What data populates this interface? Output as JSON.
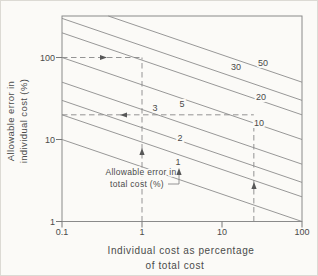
{
  "canvas": {
    "width": 318,
    "height": 276,
    "background": "#fbfaf7",
    "border": "#dcdad4"
  },
  "styles": {
    "contour_line_color": "#8c8c8c",
    "box_color": "#8a8a8a",
    "tick_color": "#787878",
    "text_color": "#4a4a4a",
    "arrow_color": "#575757",
    "guide_color": "#888888"
  },
  "chart_data": {
    "type": "line",
    "title": "",
    "x_axis": {
      "label": "Individual cost as percentage of total cost",
      "label_lines": [
        "Individual cost as percentage",
        "of total cost"
      ],
      "scale": "log",
      "min": 0.1,
      "max": 100,
      "ticks": [
        0.1,
        1,
        10,
        100
      ],
      "tick_labels": [
        "0.1",
        "1",
        "10",
        "100"
      ]
    },
    "y_axis": {
      "label": "Allowable error in individual cost (%)",
      "label_lines": [
        "Allowable error in",
        "individual cost (%)"
      ],
      "scale": "log",
      "min": 1,
      "max": 320,
      "ticks": [
        1,
        10,
        100
      ],
      "tick_labels": [
        "1",
        "10",
        "100"
      ]
    },
    "grid": false,
    "family_label": "Allowable error in total cost (%)",
    "relation": "individual_error_pct = total_error_pct * (100 / individual_cost_pct)^(1/3)",
    "contours": [
      {
        "total_error_pct": 1,
        "label": "1",
        "label_px": [
          177,
          161
        ]
      },
      {
        "total_error_pct": 2,
        "label": "2",
        "label_px": [
          179,
          137
        ]
      },
      {
        "total_error_pct": 3,
        "label": "3",
        "label_px": [
          154,
          107
        ]
      },
      {
        "total_error_pct": 5,
        "label": "5",
        "label_px": [
          181,
          103
        ]
      },
      {
        "total_error_pct": 10,
        "label": "10",
        "label_px": [
          258,
          122
        ]
      },
      {
        "total_error_pct": 20,
        "label": "20",
        "label_px": [
          260,
          96
        ]
      },
      {
        "total_error_pct": 30,
        "label": "30",
        "label_px": [
          235,
          66
        ]
      },
      {
        "total_error_pct": 50,
        "label": "50",
        "label_px": [
          262,
          62
        ]
      }
    ],
    "worked_example_guides": [
      {
        "type": "horizontal",
        "y": 100,
        "from_x": 0.1,
        "to_x": 1,
        "arrow": {
          "dir": "right",
          "px": [
            106,
            56.5
          ]
        }
      },
      {
        "type": "vertical",
        "x": 1,
        "from_y": 1,
        "to_y": 100,
        "arrow": {
          "dir": "up",
          "px": [
            141,
            147
          ]
        }
      },
      {
        "type": "horizontal",
        "y": 20,
        "from_x": 0.1,
        "to_x": 25,
        "arrow": {
          "dir": "left",
          "px": [
            119,
            114
          ]
        }
      },
      {
        "type": "vertical",
        "x": 25,
        "from_y": 1,
        "to_y": 16,
        "arrow": {
          "dir": "up",
          "px": [
            253,
            181
          ]
        }
      }
    ],
    "annotation": {
      "lines": [
        "Allowable error in",
        "total cost (%)"
      ],
      "line_px": [
        [
          140,
          174
        ],
        [
          136,
          186
        ]
      ],
      "leader": {
        "elbow": [
          [
            167,
            183
          ],
          [
            178,
            183
          ],
          [
            178,
            170
          ]
        ],
        "arrow_tip": [
          178,
          167
        ]
      }
    }
  },
  "layout_px": {
    "plot": {
      "left": 61,
      "right": 301,
      "top": 15,
      "bottom": 220.5
    },
    "x_px_per_decade": 80,
    "y_px_per_decade": 82,
    "y_title_anchor": [
      13,
      120
    ],
    "x_title_anchor": [
      [
        180,
        253
      ],
      [
        174,
        268
      ]
    ],
    "y_tick_label_x": 54,
    "x_tick_label_y": 234
  }
}
